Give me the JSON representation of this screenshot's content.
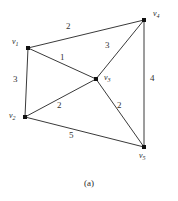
{
  "figure": {
    "caption": "(a)",
    "type": "weighted-undirected-graph",
    "colors": {
      "edge": "#3a3a3a",
      "vertex": "#111111",
      "text": "#2a2a2a",
      "background": "#ffffff"
    }
  },
  "graph_data": {
    "type": "graph",
    "directed": false,
    "weighted": true,
    "vertices": [
      {
        "id": "v1",
        "label_base": "v",
        "label_sub": "1",
        "x": 28,
        "y": 48,
        "label_x": 12,
        "label_y": 38
      },
      {
        "id": "v2",
        "label_base": "v",
        "label_sub": "2",
        "x": 25,
        "y": 117,
        "label_x": 9,
        "label_y": 112
      },
      {
        "id": "v3",
        "label_base": "v",
        "label_sub": "3",
        "x": 96,
        "y": 79,
        "label_x": 104,
        "label_y": 74
      },
      {
        "id": "v4",
        "label_base": "v",
        "label_sub": "4",
        "x": 144,
        "y": 20,
        "label_x": 153,
        "label_y": 10
      },
      {
        "id": "v5",
        "label_base": "v",
        "label_sub": "5",
        "x": 144,
        "y": 147,
        "label_x": 139,
        "label_y": 152
      }
    ],
    "edges": [
      {
        "id": "e-v1-v4",
        "source": "v1",
        "target": "v4",
        "weight": "2",
        "label_x": 66,
        "label_y": 22
      },
      {
        "id": "e-v1-v3",
        "source": "v1",
        "target": "v3",
        "weight": "1",
        "label_x": 60,
        "label_y": 53
      },
      {
        "id": "e-v1-v2",
        "source": "v1",
        "target": "v2",
        "weight": "3",
        "label_x": 13,
        "label_y": 75
      },
      {
        "id": "e-v4-v3",
        "source": "v4",
        "target": "v3",
        "weight": "3",
        "label_x": 105,
        "label_y": 41
      },
      {
        "id": "e-v4-v5",
        "source": "v4",
        "target": "v5",
        "weight": "4",
        "label_x": 150,
        "label_y": 74
      },
      {
        "id": "e-v2-v3",
        "source": "v2",
        "target": "v3",
        "weight": "2",
        "label_x": 57,
        "label_y": 101
      },
      {
        "id": "e-v3-v5",
        "source": "v3",
        "target": "v5",
        "weight": "2",
        "label_x": 117,
        "label_y": 101
      },
      {
        "id": "e-v2-v5",
        "source": "v2",
        "target": "v5",
        "weight": "5",
        "label_x": 69,
        "label_y": 131
      }
    ]
  }
}
